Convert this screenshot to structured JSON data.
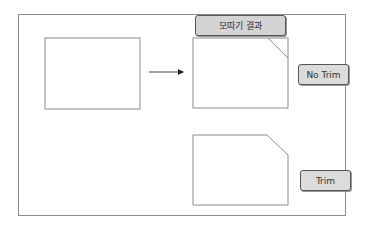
{
  "diagram": {
    "title_label": "모따기 결과",
    "options": [
      {
        "label": "No Trim"
      },
      {
        "label": "Trim"
      }
    ],
    "colors": {
      "stroke": "#8c8c8c",
      "label_fill": "#d4d4d4",
      "label_border": "#555555"
    }
  }
}
